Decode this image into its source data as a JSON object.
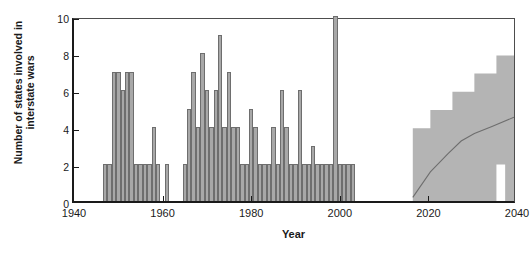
{
  "chart_data": {
    "type": "bar",
    "title": "",
    "xlabel": "Year",
    "ylabel": "Number of states involved in interstate wars",
    "xlim": [
      1940,
      2040
    ],
    "ylim": [
      0,
      10
    ],
    "xticks": [
      1940,
      1960,
      1980,
      2000,
      2020,
      2040
    ],
    "yticks": [
      0,
      2,
      4,
      6,
      8,
      10
    ],
    "grid": false,
    "legend": null,
    "bar_color": "#a8a8a8",
    "bar_edge_color": "#6e6e6e",
    "band_color": "#b4b4b4",
    "median_color": "#6e6e6e",
    "axis_color": "#1a1a1a",
    "series": [
      {
        "name": "Historical states involved in interstate wars",
        "type": "bar",
        "x": [
          1947,
          1948,
          1949,
          1950,
          1951,
          1952,
          1953,
          1954,
          1955,
          1956,
          1957,
          1958,
          1959,
          1960,
          1961,
          1962,
          1963,
          1964,
          1965,
          1966,
          1967,
          1968,
          1969,
          1970,
          1971,
          1972,
          1973,
          1974,
          1975,
          1976,
          1977,
          1978,
          1979,
          1980,
          1981,
          1982,
          1983,
          1984,
          1985,
          1986,
          1987,
          1988,
          1989,
          1990,
          1991,
          1992,
          1993,
          1994,
          1995,
          1996,
          1997,
          1998,
          1999,
          2000,
          2001,
          2002,
          2003
        ],
        "values": [
          2,
          2,
          7,
          7,
          6,
          7,
          7,
          2,
          2,
          2,
          2,
          4,
          2,
          0,
          2,
          0,
          0,
          0,
          2,
          5,
          7,
          4,
          8,
          6,
          4,
          6,
          9,
          4,
          7,
          4,
          4,
          2,
          2,
          5,
          4,
          2,
          2,
          2,
          4,
          2,
          6,
          4,
          2,
          2,
          6,
          2,
          2,
          3,
          2,
          2,
          2,
          2,
          10,
          2,
          2,
          2,
          2
        ]
      },
      {
        "name": "Projection band (upper bound)",
        "type": "step-area",
        "x": [
          2017,
          2021,
          2026,
          2031,
          2036,
          2040
        ],
        "values": [
          4,
          5,
          6,
          7,
          8,
          8
        ]
      },
      {
        "name": "Projection band (lower bound)",
        "type": "step-area",
        "x": [
          2017,
          2034,
          2036,
          2038,
          2040
        ],
        "values": [
          0,
          0,
          2,
          0,
          2
        ]
      },
      {
        "name": "Projection median",
        "type": "line",
        "x": [
          2017,
          2021,
          2025,
          2028,
          2031,
          2035,
          2040
        ],
        "values": [
          0.2,
          1.6,
          2.6,
          3.3,
          3.7,
          4.1,
          4.6
        ]
      }
    ]
  }
}
